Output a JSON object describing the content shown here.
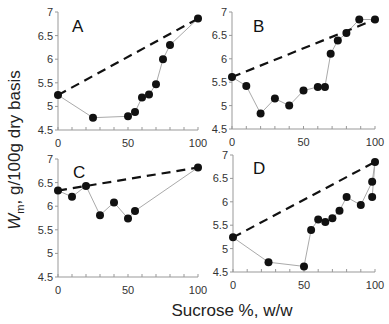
{
  "chart_data": [
    {
      "type": "line",
      "panel": "A",
      "xlabel": "Sucrose %, w/w",
      "ylabel": "Wm, g/100g dry basis",
      "xlim": [
        0,
        100
      ],
      "ylim": [
        4.5,
        7
      ],
      "xticks": [
        0,
        50,
        100
      ],
      "yticks": [
        4.5,
        5,
        5.5,
        6,
        6.5,
        7
      ],
      "series": [
        {
          "name": "measured",
          "x": [
            0,
            25,
            50,
            55,
            60,
            65,
            70,
            75,
            80,
            100
          ],
          "y": [
            5.24,
            4.76,
            4.79,
            4.88,
            5.19,
            5.25,
            5.47,
            6.0,
            6.3,
            6.86
          ]
        },
        {
          "name": "ideal",
          "style": "dashed",
          "x": [
            0,
            100
          ],
          "y": [
            5.24,
            6.86
          ]
        }
      ]
    },
    {
      "type": "line",
      "panel": "B",
      "xlim": [
        0,
        100
      ],
      "ylim": [
        4.5,
        7
      ],
      "xticks": [
        0,
        50,
        100
      ],
      "yticks": [
        4.5,
        5,
        5.5,
        6,
        6.5,
        7
      ],
      "series": [
        {
          "name": "measured",
          "x": [
            0,
            10,
            20,
            30,
            40,
            50,
            60,
            65,
            69,
            74,
            80,
            89,
            100
          ],
          "y": [
            5.61,
            5.42,
            4.83,
            5.15,
            5.0,
            5.32,
            5.4,
            5.4,
            6.11,
            6.39,
            6.55,
            6.84,
            6.84
          ]
        },
        {
          "name": "ideal",
          "style": "dashed",
          "x": [
            0,
            100
          ],
          "y": [
            5.61,
            6.84
          ]
        }
      ]
    },
    {
      "type": "line",
      "panel": "C",
      "xlim": [
        0,
        100
      ],
      "ylim": [
        4.5,
        7
      ],
      "xticks": [
        0,
        50,
        100
      ],
      "yticks": [
        4.5,
        5,
        5.5,
        6,
        6.5,
        7
      ],
      "series": [
        {
          "name": "measured",
          "x": [
            0,
            10,
            20,
            30,
            40,
            50,
            55,
            100
          ],
          "y": [
            6.33,
            6.2,
            6.43,
            5.81,
            6.08,
            5.74,
            5.9,
            6.82
          ]
        },
        {
          "name": "ideal",
          "style": "dashed",
          "x": [
            0,
            100
          ],
          "y": [
            6.33,
            6.82
          ]
        }
      ]
    },
    {
      "type": "line",
      "panel": "D",
      "xlim": [
        0,
        100
      ],
      "ylim": [
        4.5,
        7
      ],
      "xticks": [
        0,
        50,
        100
      ],
      "yticks": [
        4.5,
        5,
        5.5,
        6,
        6.5,
        7
      ],
      "series": [
        {
          "name": "measured",
          "x": [
            0,
            25,
            50,
            55,
            60,
            65,
            70,
            75,
            80,
            90,
            98,
            100,
            98
          ],
          "y": [
            5.24,
            4.71,
            4.62,
            5.4,
            5.62,
            5.57,
            5.65,
            5.81,
            6.1,
            5.93,
            6.43,
            6.85,
            6.1
          ]
        },
        {
          "name": "ideal",
          "style": "dashed",
          "x": [
            0,
            100
          ],
          "y": [
            5.24,
            6.85
          ]
        }
      ]
    }
  ],
  "figure": {
    "xlabel": "Sucrose %, w/w",
    "ylabel_main": "W",
    "ylabel_sub": "m",
    "ylabel_rest": ", g/100g dry basis",
    "panels": [
      "A",
      "B",
      "C",
      "D"
    ],
    "colors": {
      "marker": "#111111",
      "data_line": "#aaaaaa",
      "dashed": "#111111",
      "axis": "#999999"
    }
  }
}
